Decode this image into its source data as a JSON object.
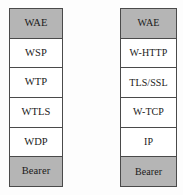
{
  "figure": {
    "background_color": "#fdfdfd",
    "border_color": "#4a4a4a",
    "shaded_color": "#b5b5b5",
    "cell_color": "#ffffff",
    "text_color": "#1a1a1a"
  },
  "stacks": [
    {
      "name": "wap-stack",
      "layers": [
        {
          "label": "WAE",
          "shaded": true
        },
        {
          "label": "WSP",
          "shaded": false
        },
        {
          "label": "WTP",
          "shaded": false
        },
        {
          "label": "WTLS",
          "shaded": false
        },
        {
          "label": "WDP",
          "shaded": false
        },
        {
          "label": "Bearer",
          "shaded": true
        }
      ]
    },
    {
      "name": "internet-stack",
      "layers": [
        {
          "label": "WAE",
          "shaded": true
        },
        {
          "label": "W-HTTP",
          "shaded": false
        },
        {
          "label": "TLS/SSL",
          "shaded": false
        },
        {
          "label": "W-TCP",
          "shaded": false
        },
        {
          "label": "IP",
          "shaded": false
        },
        {
          "label": "Bearer",
          "shaded": true
        }
      ]
    }
  ]
}
